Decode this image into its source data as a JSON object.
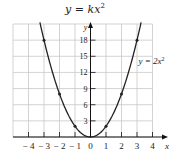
{
  "header": {
    "title": "y = kx",
    "title_exponent": "2"
  },
  "chart_data": {
    "type": "line",
    "xlabel": "x",
    "ylabel": "y",
    "xlim": [
      -5,
      5
    ],
    "ylim": [
      0,
      21
    ],
    "grid": true,
    "x_ticks": [
      -4,
      -3,
      -2,
      -1,
      0,
      1,
      2,
      3,
      4
    ],
    "y_ticks": [
      3,
      6,
      9,
      12,
      15,
      18
    ],
    "series": [
      {
        "name": "y = 2x^2",
        "function": "2*x^2",
        "points": [
          {
            "x": -3,
            "y": 18
          },
          {
            "x": -2,
            "y": 8
          },
          {
            "x": -1,
            "y": 2
          },
          {
            "x": 0,
            "y": 0
          },
          {
            "x": 1,
            "y": 2
          },
          {
            "x": 2,
            "y": 8
          },
          {
            "x": 3,
            "y": 18
          }
        ],
        "marked_points": [
          [
            -3,
            18
          ],
          [
            -2,
            8
          ],
          [
            -1,
            2
          ],
          [
            1,
            2
          ],
          [
            2,
            8
          ],
          [
            3,
            18
          ]
        ]
      }
    ],
    "annotations": [
      {
        "text": "y = 2x^2",
        "x": 3.4,
        "y": 14
      }
    ]
  },
  "labels": {
    "curve_label": "y = 2x",
    "curve_label_exp": "2",
    "x_axis": "x",
    "y_axis": "y",
    "x_ticks": [
      "− 4",
      "− 3",
      "− 2",
      "− 1",
      "0",
      "1",
      "2",
      "3",
      "4"
    ],
    "y_ticks": [
      "18",
      "15",
      "12",
      "9",
      "6",
      "3"
    ]
  },
  "colors": {
    "grid": "#c8c8c8",
    "axis": "#111111",
    "curve": "#222222"
  }
}
